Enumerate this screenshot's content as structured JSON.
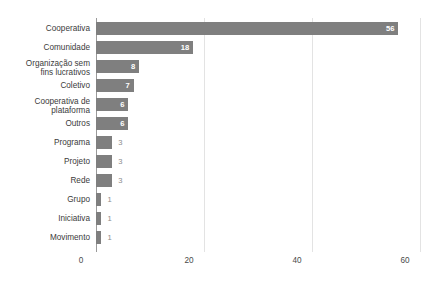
{
  "chart_data": {
    "type": "bar",
    "orientation": "horizontal",
    "title": "",
    "subtitle": "",
    "xlabel": "",
    "ylabel": "",
    "categories": [
      "Cooperativa",
      "Comunidade",
      "Organização sem\nfins lucrativos",
      "Coletivo",
      "Cooperativa de\nplataforma",
      "Outros",
      "Programa",
      "Projeto",
      "Rede",
      "Grupo",
      "Iniciativa",
      "Movimento"
    ],
    "values": [
      56,
      18,
      8,
      7,
      6,
      6,
      3,
      3,
      3,
      1,
      1,
      1
    ],
    "data_labels": [
      "56",
      "18",
      "8",
      "7",
      "6",
      "6",
      "3",
      "3",
      "3",
      "1",
      "1",
      "1"
    ],
    "xlim": [
      0,
      60
    ],
    "xticks": [
      0,
      20,
      40,
      60
    ],
    "xtick_labels": [
      "0",
      "20",
      "40",
      "60"
    ],
    "grid": true,
    "grid_axis": "x",
    "legend": false,
    "bar_color": "#7f7f7f",
    "grid_color": "#e3e3e3",
    "axis_color": "#9a9a9a",
    "label_color_inside": "#ffffff",
    "label_color_outside": "#8c8c8c",
    "background": "#ffffff"
  }
}
